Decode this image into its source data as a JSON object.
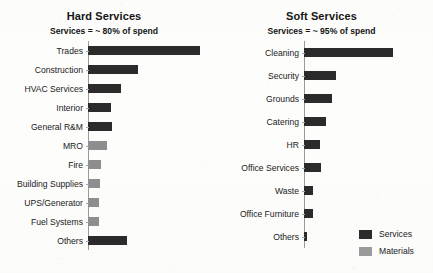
{
  "chart_data": [
    {
      "type": "bar",
      "orientation": "horizontal",
      "title": "Hard Services",
      "subtitle": "Services = ~ 80% of spend",
      "xlabel": "",
      "ylabel": "",
      "grid": false,
      "categories": [
        "Trades",
        "Construction",
        "HVAC Services",
        "Interior",
        "General R&M",
        "MRO",
        "Fire",
        "Building Supplies",
        "UPS/Generator",
        "Fuel Systems",
        "Others"
      ],
      "values": [
        112,
        50,
        33,
        23,
        24,
        19,
        13,
        12,
        11,
        11,
        39
      ],
      "series_of": [
        "Services",
        "Services",
        "Services",
        "Services",
        "Services",
        "Materials",
        "Materials",
        "Materials",
        "Materials",
        "Materials",
        "Services"
      ]
    },
    {
      "type": "bar",
      "orientation": "horizontal",
      "title": "Soft Services",
      "subtitle": "Services = ~ 95% of spend",
      "xlabel": "",
      "ylabel": "",
      "grid": false,
      "categories": [
        "Cleaning",
        "Security",
        "Grounds",
        "Catering",
        "HR",
        "Office Services",
        "Waste",
        "Office Furniture",
        "Others"
      ],
      "values": [
        89,
        32,
        28,
        22,
        16,
        17,
        9,
        9,
        3
      ],
      "series_of": [
        "Services",
        "Services",
        "Services",
        "Services",
        "Services",
        "Services",
        "Services",
        "Services",
        "Services"
      ]
    }
  ],
  "legend": {
    "position": "bottom-right",
    "entries": [
      {
        "label": "Services",
        "color": "#2b2b2b"
      },
      {
        "label": "Materials",
        "color": "#9a9a9a"
      }
    ]
  }
}
